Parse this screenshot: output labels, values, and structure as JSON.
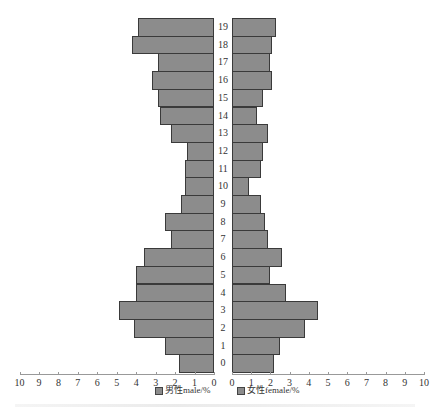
{
  "chart_data": {
    "type": "bar",
    "orientation": "horizontal",
    "subtype": "population-pyramid",
    "title": "",
    "xlabel": "",
    "ylabel": "",
    "categories": [
      "0",
      "1",
      "2",
      "3",
      "4",
      "5",
      "6",
      "7",
      "8",
      "9",
      "10",
      "11",
      "12",
      "13",
      "14",
      "15",
      "16",
      "17",
      "18",
      "19"
    ],
    "series": [
      {
        "name": "男性male/%",
        "side": "left",
        "values": [
          1.8,
          2.5,
          4.1,
          4.9,
          4.0,
          4.0,
          3.6,
          2.2,
          2.5,
          1.7,
          1.5,
          1.5,
          1.4,
          2.2,
          2.8,
          2.9,
          3.2,
          2.9,
          4.2,
          3.9
        ]
      },
      {
        "name": "女性female/%",
        "side": "right",
        "values": [
          2.2,
          2.5,
          3.8,
          4.5,
          2.8,
          2.0,
          2.6,
          1.9,
          1.7,
          1.5,
          0.9,
          1.5,
          1.6,
          1.9,
          1.3,
          1.6,
          2.1,
          2.0,
          2.1,
          2.3
        ]
      }
    ],
    "x_ticks_left": [
      "10",
      "9",
      "8",
      "7",
      "6",
      "5",
      "4",
      "3",
      "2",
      "1",
      "0"
    ],
    "x_ticks_right": [
      "0",
      "1",
      "2",
      "3",
      "4",
      "5",
      "6",
      "7",
      "8",
      "9",
      "10"
    ],
    "xlim": [
      0,
      10
    ],
    "grid": false,
    "legend_position": "bottom",
    "colors": {
      "bar_fill": "#8c8c8c",
      "bar_border": "#3a3a3a"
    }
  },
  "legend": {
    "male_label": "男性male/%",
    "female_label": "女性female/%"
  }
}
